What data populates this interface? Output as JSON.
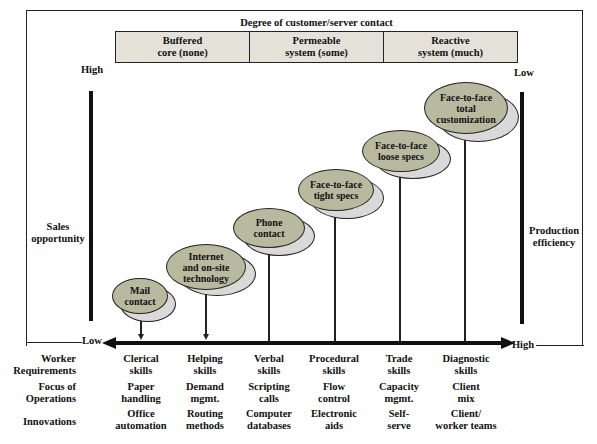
{
  "header": {
    "title": "Degree of customer/server contact"
  },
  "contact_levels": [
    {
      "line1": "Buffered",
      "line2": "core (none)"
    },
    {
      "line1": "Permeable",
      "line2": "system (some)"
    },
    {
      "line1": "Reactive",
      "line2": "system (much)"
    }
  ],
  "left_axis": {
    "top": "High",
    "label_line1": "Sales",
    "label_line2": "opportunity",
    "bottom": "Low"
  },
  "right_axis": {
    "top": "Low",
    "label_line1": "Production",
    "label_line2": "efficiency",
    "bottom": "High"
  },
  "bubbles": [
    {
      "line1": "Mail",
      "line2": "contact",
      "line3": ""
    },
    {
      "line1": "Internet",
      "line2": "and on-site",
      "line3": "technology"
    },
    {
      "line1": "Phone",
      "line2": "contact",
      "line3": ""
    },
    {
      "line1": "Face-to-face",
      "line2": "tight specs",
      "line3": ""
    },
    {
      "line1": "Face-to-face",
      "line2": "loose specs",
      "line3": ""
    },
    {
      "line1": "Face-to-face",
      "line2": "total",
      "line3": "customization"
    }
  ],
  "rows": [
    {
      "label_line1": "Worker",
      "label_line2": "Requirements",
      "cells": [
        [
          "Clerical",
          "skills"
        ],
        [
          "Helping",
          "skills"
        ],
        [
          "Verbal",
          "skills"
        ],
        [
          "Procedural",
          "skills"
        ],
        [
          "Trade",
          "skills"
        ],
        [
          "Diagnostic",
          "skills"
        ]
      ]
    },
    {
      "label_line1": "Focus of",
      "label_line2": "Operations",
      "cells": [
        [
          "Paper",
          "handling"
        ],
        [
          "Demand",
          "mgmt."
        ],
        [
          "Scripting",
          "calls"
        ],
        [
          "Flow",
          "control"
        ],
        [
          "Capacity",
          "mgmt."
        ],
        [
          "Client",
          "mix"
        ]
      ]
    },
    {
      "label_line1": "Innovations",
      "label_line2": "",
      "cells": [
        [
          "Office",
          "automation"
        ],
        [
          "Routing",
          "methods"
        ],
        [
          "Computer",
          "databases"
        ],
        [
          "Electronic",
          "aids"
        ],
        [
          "Self-",
          "serve"
        ],
        [
          "Client/",
          "worker teams"
        ]
      ]
    }
  ],
  "colors": {
    "bubble_fill": "#b9b9a0",
    "bubble_shadow": "#d9d9d9",
    "header_box_fill": "#e4e1d8",
    "line": "#222222"
  }
}
